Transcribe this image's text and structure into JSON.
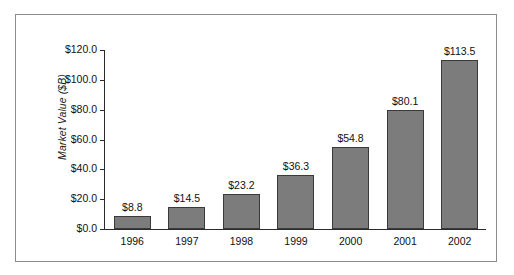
{
  "chart_data": {
    "type": "bar",
    "title": "",
    "xlabel": "",
    "ylabel": "Market Value ($B)",
    "categories": [
      "1996",
      "1997",
      "1998",
      "1999",
      "2000",
      "2001",
      "2002"
    ],
    "values": [
      8.8,
      14.5,
      23.2,
      36.3,
      54.8,
      80.1,
      113.5
    ],
    "data_labels": [
      "$8.8",
      "$14.5",
      "$23.2",
      "$36.3",
      "$54.8",
      "$80.1",
      "$113.5"
    ],
    "ylim": [
      0,
      120
    ],
    "ytick_values": [
      0,
      20,
      40,
      60,
      80,
      100,
      120
    ],
    "ytick_labels": [
      "$0.0",
      "$20.0",
      "$40.0",
      "$60.0",
      "$80.0",
      "$100.0",
      "$120.0"
    ],
    "grid": false,
    "legend": "none",
    "series": [
      {
        "name": "Market Value",
        "values": [
          8.8,
          14.5,
          23.2,
          36.3,
          54.8,
          80.1,
          113.5
        ]
      }
    ],
    "colors": {
      "bar_fill": "#7c7c7c",
      "bar_border": "#3a3a3a",
      "axis": "#2b2b2b",
      "text": "#111111",
      "frame_border": "#8c8c8c",
      "background": "#ffffff"
    }
  }
}
